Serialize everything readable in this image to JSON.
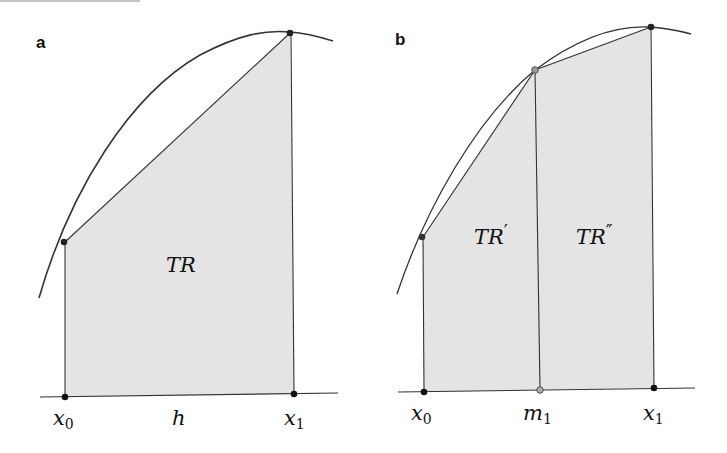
{
  "figure": {
    "colors": {
      "fill": "#e4e4e4",
      "stroke": "#333333",
      "point": "#111111",
      "hollow_point": "#888888",
      "background": "#ffffff"
    }
  },
  "panels": [
    {
      "letter": "a",
      "region_label": {
        "main": "TR",
        "prime": ""
      },
      "axis_labels": [
        {
          "main": "x",
          "sub": "0"
        },
        {
          "main": "h",
          "sub": ""
        },
        {
          "main": "x",
          "sub": "1"
        }
      ]
    },
    {
      "letter": "b",
      "region_labels": [
        {
          "main": "TR",
          "prime": "′"
        },
        {
          "main": "TR",
          "prime": "″"
        }
      ],
      "axis_labels": [
        {
          "main": "x",
          "sub": "0"
        },
        {
          "main": "m",
          "sub": "1"
        },
        {
          "main": "x",
          "sub": "1"
        }
      ]
    }
  ]
}
